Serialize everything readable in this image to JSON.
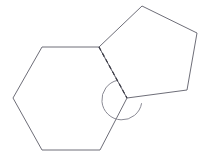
{
  "figure": {
    "background_color": "#ffffff",
    "width": 207,
    "height": 163,
    "stroke_color": "#6e6e78",
    "dashed_stroke_color": "#3a3a44",
    "arc_stroke_color": "#8a8a94",
    "shapes": [
      {
        "name": "hexagon",
        "sides": 6,
        "points": "99,47 42,47 13,98 42,150 100,150 127,98",
        "fill": "#ffffff"
      },
      {
        "name": "pentagon",
        "sides": 5,
        "points": "99,47 142,6 197,33 187,90 127,98",
        "fill": "#ffffff"
      }
    ],
    "shared_edge": {
      "name": "shared-edge",
      "style": "dashed",
      "from_x": 99,
      "from_y": 47,
      "to_x": 127,
      "to_y": 98
    },
    "angle_marker": {
      "name": "reflex-angle-arc",
      "center_x": 127,
      "center_y": 98,
      "radius": 20,
      "path": "M 117.6 80.3 A 20 20 0 1 0 141.6 103.2"
    }
  }
}
